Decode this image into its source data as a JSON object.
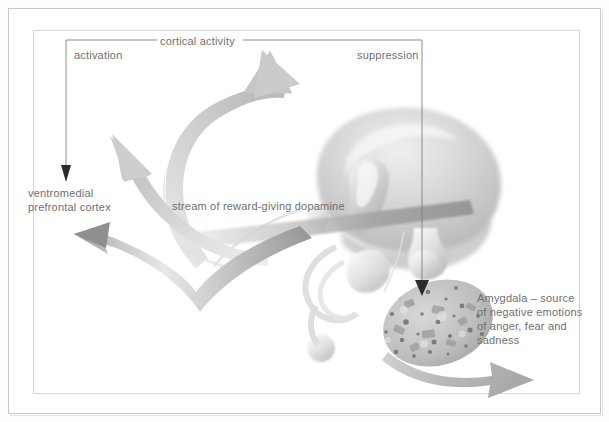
{
  "figure": {
    "type": "brain-diagram",
    "title": "",
    "labels": {
      "activation": "activation",
      "cortical_activity": "cortical activity",
      "suppression": "suppression",
      "ventromedial_prefrontal_cortex": "ventromedial\nprefrontal cortex",
      "dopamine_stream": "stream of reward-giving dopamine",
      "amygdala": "Amygdala – source\nof negative emotions\nof anger, fear and\nsadness"
    },
    "icons": {
      "activation_arrow": "arrow-down-icon",
      "suppression_arrow": "arrow-down-icon",
      "cortical_arrow": "curved-arrow-up-right-icon",
      "vmpfc_arrow": "curved-arrow-up-left-icon",
      "dopamine_ribbon": "ribbon-arrow-left-icon",
      "amygdala_output_arrow": "arrow-right-icon",
      "brain": "brain-illustration",
      "amygdala_body": "amygdala-speckled-ellipse"
    },
    "colors": {
      "text": "#6f6f6f",
      "line": "#7a7a7a",
      "frame": "#c9c9c9",
      "inner_frame": "#d6d6d6",
      "arrow_light": "#d9d9d9",
      "arrow_mid": "#b5b5b5",
      "arrow_dark": "#8f8f8f",
      "brain_fill": "#c4c4c4",
      "background": "#ffffff"
    }
  }
}
